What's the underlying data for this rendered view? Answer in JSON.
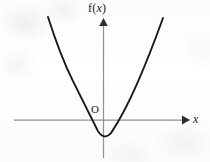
{
  "figure": {
    "background_color": "#fdfdfd",
    "width": 210,
    "height": 162
  },
  "labels": {
    "function_label_prefix": "f(",
    "function_label_var": "x",
    "function_label_suffix": ")",
    "origin_label": "O",
    "x_axis_label": "x"
  },
  "chart_data": {
    "type": "line",
    "title": "",
    "subtitle": "",
    "xlabel": "x",
    "ylabel": "f(x)",
    "grid": false,
    "legend": "none",
    "annotations": [
      {
        "text": "f(x)",
        "role": "y-axis-label",
        "position": "top of vertical axis"
      },
      {
        "text": "O",
        "role": "origin-label",
        "position": "left of y-axis, above x-axis"
      },
      {
        "text": "x",
        "role": "x-axis-label",
        "position": "right of horizontal axis arrow"
      }
    ],
    "axes": {
      "x_axis": {
        "visible": true,
        "arrow": "right",
        "pixel_y": 120,
        "pixel_x_start": 14,
        "pixel_x_end": 190,
        "tick_labels": []
      },
      "y_axis": {
        "visible": true,
        "arrow": "up",
        "pixel_x": 103.5,
        "pixel_y_start": 20,
        "pixel_y_end": 158,
        "tick_labels": []
      }
    },
    "series": [
      {
        "name": "f(x)",
        "shape": "parabola-opening-upward",
        "color": "#1a1a1a",
        "vertex": {
          "x_px": 105,
          "y_px": 142
        },
        "roots_px": [
          80,
          129
        ],
        "y_intercept_px": {
          "x_px": 103.5,
          "y_px": 141
        },
        "endpoints_px": [
          {
            "x_px": 48,
            "y_px": 17
          },
          {
            "x_px": 163,
            "y_px": 18
          }
        ],
        "path": "M 48,17 Q 60.5,56.2 73,81.2 Q 85.5,106.2 98,131.2 Q 104.5,140.6 111,133.1 Q 124,113.6 137,83.9 Q 150,54.2 163,18",
        "points_px": [
          {
            "x": 48,
            "y": 17
          },
          {
            "x": 60,
            "y": 51
          },
          {
            "x": 70,
            "y": 76
          },
          {
            "x": 80,
            "y": 100
          },
          {
            "x": 90,
            "y": 123
          },
          {
            "x": 98,
            "y": 135
          },
          {
            "x": 105,
            "y": 142
          },
          {
            "x": 112,
            "y": 136
          },
          {
            "x": 120,
            "y": 124
          },
          {
            "x": 130,
            "y": 103
          },
          {
            "x": 140,
            "y": 78
          },
          {
            "x": 152,
            "y": 49
          },
          {
            "x": 163,
            "y": 18
          }
        ]
      }
    ]
  }
}
